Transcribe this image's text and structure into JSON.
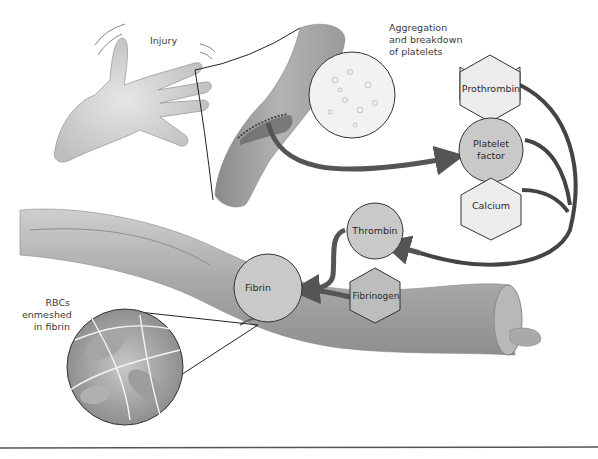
{
  "diagram": {
    "type": "blood-clotting-cascade-illustration",
    "labels": {
      "injury": "Injury",
      "aggregation": "Aggregation\nand breakdown\nof platelets",
      "rbcs": "RBCs\nenmeshed\nin fibrin"
    },
    "nodes": {
      "prothrombin": {
        "label": "Prothrombin",
        "shape": "hexagon"
      },
      "platelet_factor": {
        "label": "Platelet\nfactor",
        "shape": "circle"
      },
      "calcium": {
        "label": "Calcium",
        "shape": "hexagon"
      },
      "thrombin": {
        "label": "Thrombin",
        "shape": "circle"
      },
      "fibrinogen": {
        "label": "Fibrinogen",
        "shape": "hexagon"
      },
      "fibrin": {
        "label": "Fibrin",
        "shape": "circle"
      }
    },
    "edges": [
      {
        "from": "injured-vessel",
        "to": "platelet_factor"
      },
      {
        "from": "prothrombin",
        "to": "thrombin"
      },
      {
        "from": "platelet_factor",
        "to": "thrombin"
      },
      {
        "from": "calcium",
        "to": "thrombin"
      },
      {
        "from": "thrombin",
        "to": "fibrin"
      },
      {
        "from": "fibrinogen",
        "to": "fibrin"
      }
    ],
    "colors": {
      "node_fill": "#c9c9c9",
      "hexagon_fill": "#ececec",
      "fibrinogen_fill": "#bdbdbd",
      "arrow": "#555555",
      "vessel": "#a9a9a9",
      "stroke": "#333333"
    }
  }
}
